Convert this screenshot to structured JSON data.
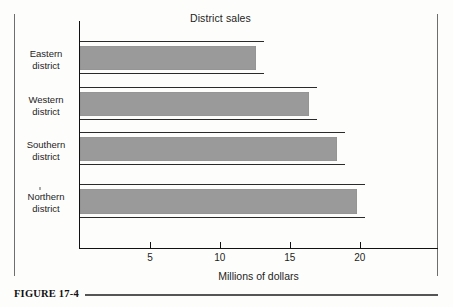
{
  "figure": {
    "caption_label": "FIGURE 17-4"
  },
  "chart_data": {
    "type": "bar",
    "orientation": "horizontal",
    "title": "District sales",
    "xlabel": "Millions of dollars",
    "ylabel": "",
    "categories": [
      "Eastern\ndistrict",
      "Western\ndistrict",
      "Southern\ndistrict",
      "Northern\ndistrict"
    ],
    "category_lines": [
      [
        "Eastern",
        "district"
      ],
      [
        "Western",
        "district"
      ],
      [
        "Southern",
        "district"
      ],
      [
        "Northern",
        "district"
      ]
    ],
    "values": [
      12.6,
      16.4,
      18.4,
      19.8
    ],
    "xlim": [
      0,
      25.6
    ],
    "xticks": [
      5,
      10,
      15,
      20
    ],
    "xtick_labels": [
      "5",
      "10",
      "15",
      "20"
    ],
    "grid": false,
    "legend": false,
    "bar_color": "#9a9a9a",
    "bar_edge_color": "#2a2a2a",
    "axis_color": "#111111"
  }
}
